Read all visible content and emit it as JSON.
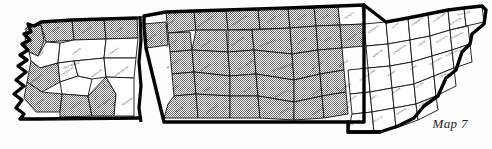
{
  "figure": {
    "caption": "Map 7",
    "colors": {
      "ink": "#000000",
      "background": "#fdfdfd",
      "shaded_fill": "#808080",
      "plain_fill": "#ffffff"
    },
    "legend_note": "",
    "shading": {
      "shaded_label": "shaded",
      "plain_label": "unshaded"
    }
  },
  "regions": [
    {
      "name": "West Tennessee",
      "shading": "mixed"
    },
    {
      "name": "Middle Tennessee",
      "shading": "mostly shaded"
    },
    {
      "name": "East Tennessee",
      "shading": "mostly unshaded"
    }
  ],
  "counties": [
    {
      "name": "LAKE",
      "x": 33,
      "y": 36,
      "rot": -38,
      "shaded": true,
      "d": "M26,28 L41,25 L44,41 L38,56 L29,52 L25,43 Z"
    },
    {
      "name": "OBION",
      "x": 56,
      "y": 30,
      "rot": -35,
      "shaded": true,
      "d": "M41,22 L72,20 L74,40 L46,42 L41,25 Z"
    },
    {
      "name": "WEAKLEY",
      "x": 88,
      "y": 30,
      "rot": -35,
      "shaded": true,
      "d": "M72,20 L104,19 L106,39 L74,40 Z"
    },
    {
      "name": "HENRY",
      "x": 120,
      "y": 30,
      "rot": -35,
      "shaded": true,
      "d": "M104,19 L137,18 L138,38 L106,39 Z"
    },
    {
      "name": "DYER",
      "x": 41,
      "y": 55,
      "rot": -38,
      "shaded": false,
      "d": "M29,52 L38,56 L46,42 L60,43 L58,63 L40,68 L31,61 Z"
    },
    {
      "name": "GIBSON",
      "x": 77,
      "y": 52,
      "rot": -35,
      "shaded": false,
      "d": "M60,43 L74,40 L106,39 L104,58 L74,61 L58,63 Z"
    },
    {
      "name": "CARROLL",
      "x": 114,
      "y": 52,
      "rot": -35,
      "shaded": false,
      "d": "M106,39 L138,38 L136,58 L104,58 Z"
    },
    {
      "name": "LAUDERDALE",
      "x": 36,
      "y": 80,
      "rot": -38,
      "shaded": true,
      "d": "M31,61 L40,68 L58,63 L60,82 L42,92 L27,82 Z"
    },
    {
      "name": "CROCKETT",
      "x": 68,
      "y": 72,
      "rot": -32,
      "shaded": false,
      "d": "M58,63 L74,61 L78,76 L60,82 Z"
    },
    {
      "name": "HAYWOOD",
      "x": 72,
      "y": 66,
      "rot": -20,
      "shaded": false,
      "big": true,
      "d": "M60,82 L78,76 L92,79 L88,96 L62,94 Z"
    },
    {
      "name": "MADISON",
      "x": 97,
      "y": 74,
      "rot": -35,
      "shaded": false,
      "d": "M74,61 L104,58 L106,77 L92,79 L78,76 Z"
    },
    {
      "name": "HENDERSON",
      "x": 122,
      "y": 72,
      "rot": -35,
      "shaded": false,
      "d": "M104,58 L136,58 L134,78 L106,77 Z"
    },
    {
      "name": "TIPTON",
      "x": 40,
      "y": 103,
      "rot": -38,
      "shaded": true,
      "d": "M27,82 L42,92 L62,94 L60,112 L36,112 L24,98 Z"
    },
    {
      "name": "FAYETTE",
      "x": 76,
      "y": 106,
      "rot": -35,
      "shaded": true,
      "d": "M62,94 L88,96 L92,116 L60,117 L60,112 Z"
    },
    {
      "name": "HARDEMAN",
      "x": 104,
      "y": 104,
      "rot": -35,
      "shaded": true,
      "d": "M88,96 L106,77 L116,94 L114,116 L92,116 Z"
    },
    {
      "name": "MCNAIRY",
      "x": 128,
      "y": 102,
      "rot": -35,
      "shaded": false,
      "d": "M106,77 L134,78 L134,116 L114,116 L116,94 Z"
    },
    {
      "name": "BENTON",
      "x": 152,
      "y": 38,
      "rot": -35,
      "shaded": true,
      "d": "M144,24 L166,22 L168,45 L146,48 Z"
    },
    {
      "name": "STEWART",
      "x": 170,
      "y": 24,
      "rot": -35,
      "shaded": true,
      "d": "M166,12 L194,11 L196,30 L168,33 Z"
    },
    {
      "name": "MONTGOMERY",
      "x": 206,
      "y": 22,
      "rot": -35,
      "shaded": true,
      "d": "M194,11 L226,10 L228,30 L196,30 Z"
    },
    {
      "name": "ROBERTSON",
      "x": 240,
      "y": 21,
      "rot": -35,
      "shaded": true,
      "d": "M226,10 L258,9 L260,29 L228,30 Z"
    },
    {
      "name": "SUMNER",
      "x": 272,
      "y": 20,
      "rot": -35,
      "shaded": true,
      "d": "M258,9 L288,8 L290,28 L260,29 Z"
    },
    {
      "name": "MACON",
      "x": 302,
      "y": 18,
      "rot": -35,
      "shaded": true,
      "d": "M288,8 L314,7 L316,26 L290,28 Z"
    },
    {
      "name": "CLAY",
      "x": 326,
      "y": 17,
      "rot": -35,
      "shaded": true,
      "d": "M314,7 L338,6 L340,25 L316,26 Z"
    },
    {
      "name": "PICKETT",
      "x": 350,
      "y": 16,
      "rot": -35,
      "shaded": false,
      "d": "M338,6 L362,5 L364,24 L340,25 Z"
    },
    {
      "name": "HOUSTON",
      "x": 172,
      "y": 44,
      "rot": -35,
      "shaded": true,
      "d": "M168,33 L190,32 L192,50 L170,52 Z"
    },
    {
      "name": "DICKSON",
      "x": 206,
      "y": 45,
      "rot": -35,
      "shaded": true,
      "d": "M196,30 L226,30 L228,52 L192,50 Z"
    },
    {
      "name": "CHEATHAM",
      "x": 238,
      "y": 42,
      "rot": -35,
      "shaded": true,
      "d": "M228,30 L252,30 L254,50 L228,52 Z"
    },
    {
      "name": "DAVIDSON",
      "x": 268,
      "y": 44,
      "rot": -20,
      "shaded": true,
      "big": true,
      "d": "M252,30 L290,28 L292,54 L254,50 Z"
    },
    {
      "name": "WILSON",
      "x": 302,
      "y": 42,
      "rot": -35,
      "shaded": true,
      "d": "M290,28 L316,26 L318,50 L292,54 Z"
    },
    {
      "name": "SMITH",
      "x": 328,
      "y": 40,
      "rot": -35,
      "shaded": true,
      "d": "M316,26 L340,25 L342,48 L318,50 Z"
    },
    {
      "name": "JACKSON",
      "x": 352,
      "y": 38,
      "rot": -35,
      "shaded": true,
      "d": "M340,25 L364,24 L364,46 L342,48 Z"
    },
    {
      "name": "HUMPHREYS",
      "x": 174,
      "y": 64,
      "rot": -35,
      "shaded": true,
      "d": "M170,52 L192,50 L194,72 L172,74 Z"
    },
    {
      "name": "HICKMAN",
      "x": 206,
      "y": 68,
      "rot": -35,
      "shaded": true,
      "d": "M192,50 L228,52 L230,76 L194,72 Z"
    },
    {
      "name": "WILLIAMSON",
      "x": 246,
      "y": 66,
      "rot": -30,
      "shaded": true,
      "d": "M228,52 L254,50 L256,74 L230,76 Z"
    },
    {
      "name": "RUTHERFORD",
      "x": 284,
      "y": 68,
      "rot": -20,
      "shaded": true,
      "big": true,
      "d": "M254,50 L292,54 L294,80 L256,74 Z"
    },
    {
      "name": "WILSON S",
      "x": 318,
      "y": 66,
      "rot": -35,
      "shaded": true,
      "d": "M292,54 L318,50 L320,74 L294,80 Z"
    },
    {
      "name": "DEKALB",
      "x": 344,
      "y": 64,
      "rot": -35,
      "shaded": true,
      "d": "M318,50 L342,48 L344,70 L320,74 Z"
    },
    {
      "name": "PERRY",
      "x": 176,
      "y": 88,
      "rot": -35,
      "shaded": true,
      "d": "M172,74 L194,72 L196,94 L174,96 Z"
    },
    {
      "name": "LEWIS",
      "x": 208,
      "y": 90,
      "rot": -35,
      "shaded": true,
      "d": "M194,72 L230,76 L230,96 L196,94 Z"
    },
    {
      "name": "MAURY",
      "x": 248,
      "y": 90,
      "rot": -30,
      "shaded": true,
      "d": "M230,76 L256,74 L258,96 L230,96 Z"
    },
    {
      "name": "MARSHALL",
      "x": 282,
      "y": 94,
      "rot": -30,
      "shaded": true,
      "d": "M256,74 L294,80 L294,102 L258,96 Z"
    },
    {
      "name": "BEDFORD",
      "x": 318,
      "y": 92,
      "rot": -35,
      "shaded": true,
      "d": "M294,80 L320,74 L322,96 L294,102 Z"
    },
    {
      "name": "WARREN",
      "x": 346,
      "y": 88,
      "rot": -35,
      "shaded": true,
      "d": "M320,74 L344,70 L346,92 L322,96 Z"
    },
    {
      "name": "WAYNE",
      "x": 180,
      "y": 110,
      "rot": -35,
      "shaded": true,
      "d": "M174,96 L196,94 L198,118 L164,118 L168,104 Z"
    },
    {
      "name": "LAWRENCE",
      "x": 212,
      "y": 110,
      "rot": -35,
      "shaded": true,
      "d": "M196,94 L230,96 L230,118 L198,118 Z"
    },
    {
      "name": "GILES",
      "x": 250,
      "y": 110,
      "rot": -30,
      "shaded": true,
      "d": "M230,96 L258,96 L260,118 L230,118 Z"
    },
    {
      "name": "LINCOLN",
      "x": 284,
      "y": 112,
      "rot": -30,
      "shaded": true,
      "d": "M258,96 L294,102 L294,120 L260,118 Z"
    },
    {
      "name": "FRANKLIN",
      "x": 318,
      "y": 112,
      "rot": -35,
      "shaded": true,
      "d": "M294,102 L322,96 L324,118 L294,120 Z"
    },
    {
      "name": "GRUNDY",
      "x": 346,
      "y": 110,
      "rot": -35,
      "shaded": true,
      "d": "M322,96 L346,92 L348,114 L324,118 Z"
    },
    {
      "name": "FENTRESS",
      "x": 374,
      "y": 30,
      "rot": -35,
      "shaded": false,
      "d": "M364,24 L386,22 L388,44 L366,46 Z"
    },
    {
      "name": "SCOTT",
      "x": 396,
      "y": 26,
      "rot": -35,
      "shaded": false,
      "d": "M386,22 L408,18 L410,40 L388,44 Z"
    },
    {
      "name": "CAMPBELL",
      "x": 418,
      "y": 22,
      "rot": -35,
      "shaded": false,
      "d": "M408,18 L428,14 L430,36 L410,40 Z"
    },
    {
      "name": "CLAIBORNE",
      "x": 440,
      "y": 18,
      "rot": -35,
      "shaded": false,
      "d": "M428,14 L448,10 L450,30 L430,36 Z"
    },
    {
      "name": "HANCOCK",
      "x": 456,
      "y": 22,
      "rot": -30,
      "shaded": false,
      "d": "M448,10 L464,8 L466,26 L450,30 Z"
    },
    {
      "name": "SULLIVAN",
      "x": 464,
      "y": 14,
      "rot": -12,
      "shaded": false,
      "d": "M464,8 L482,6 L484,22 L466,26 Z"
    },
    {
      "name": "MORGAN",
      "x": 378,
      "y": 54,
      "rot": -35,
      "shaded": false,
      "d": "M366,46 L388,44 L390,66 L368,68 Z"
    },
    {
      "name": "ANDERSON",
      "x": 400,
      "y": 50,
      "rot": -35,
      "shaded": false,
      "d": "M388,44 L410,40 L412,62 L390,66 Z"
    },
    {
      "name": "UNION",
      "x": 422,
      "y": 44,
      "rot": -35,
      "shaded": false,
      "d": "M410,40 L430,36 L432,56 L412,62 Z"
    },
    {
      "name": "GRAINGER",
      "x": 442,
      "y": 40,
      "rot": -30,
      "shaded": false,
      "d": "M430,36 L450,30 L452,50 L432,56 Z"
    },
    {
      "name": "HAWKINS",
      "x": 458,
      "y": 36,
      "rot": -25,
      "shaded": false,
      "d": "M450,30 L468,26 L470,44 L452,50 Z"
    },
    {
      "name": "CUMBERLAND",
      "x": 368,
      "y": 76,
      "rot": -35,
      "shaded": false,
      "d": "M348,70 L368,68 L370,92 L350,94 Z"
    },
    {
      "name": "ROANE",
      "x": 392,
      "y": 74,
      "rot": -35,
      "shaded": false,
      "d": "M368,68 L390,66 L392,88 L370,92 Z"
    },
    {
      "name": "KNOX",
      "x": 414,
      "y": 68,
      "rot": -35,
      "shaded": false,
      "d": "M390,66 L412,62 L414,84 L392,88 Z"
    },
    {
      "name": "JEFFERSON",
      "x": 436,
      "y": 62,
      "rot": -30,
      "shaded": false,
      "d": "M412,62 L432,56 L434,76 L414,84 Z"
    },
    {
      "name": "HAMBLEN",
      "x": 452,
      "y": 54,
      "rot": -25,
      "shaded": false,
      "d": "M432,56 L452,50 L454,68 L434,76 Z"
    },
    {
      "name": "GREENE",
      "x": 464,
      "y": 50,
      "rot": -22,
      "shaded": false,
      "d": "M452,50 L470,44 L472,62 L454,68 Z"
    },
    {
      "name": "BLEDSOE",
      "x": 352,
      "y": 100,
      "rot": -35,
      "shaded": false,
      "d": "M350,94 L370,92 L372,112 L352,114 Z"
    },
    {
      "name": "RHEA",
      "x": 374,
      "y": 98,
      "rot": -35,
      "shaded": false,
      "d": "M370,92 L392,88 L394,108 L372,112 Z"
    },
    {
      "name": "LOUDON",
      "x": 396,
      "y": 92,
      "rot": -35,
      "shaded": false,
      "d": "M392,88 L414,84 L416,104 L394,108 Z"
    },
    {
      "name": "SEVIER",
      "x": 420,
      "y": 86,
      "rot": -30,
      "shaded": false,
      "d": "M414,84 L434,76 L436,96 L416,104 Z"
    },
    {
      "name": "COCKE",
      "x": 444,
      "y": 76,
      "rot": -25,
      "shaded": false,
      "d": "M434,76 L454,68 L456,86 L436,96 Z"
    },
    {
      "name": "HAMILTON",
      "x": 354,
      "y": 124,
      "rot": -30,
      "shaded": false,
      "d": "M352,114 L372,112 L374,132 L348,132 Z"
    },
    {
      "name": "BRADLEY",
      "x": 378,
      "y": 120,
      "rot": -30,
      "shaded": false,
      "d": "M372,112 L394,108 L396,128 L374,132 Z"
    },
    {
      "name": "MONROE",
      "x": 402,
      "y": 112,
      "rot": -30,
      "shaded": false,
      "d": "M394,108 L416,104 L418,120 L396,128 Z"
    },
    {
      "name": "BLOUNT",
      "x": 424,
      "y": 104,
      "rot": -28,
      "shaded": false,
      "d": "M416,104 L436,96 L438,110 L418,120 Z"
    }
  ]
}
